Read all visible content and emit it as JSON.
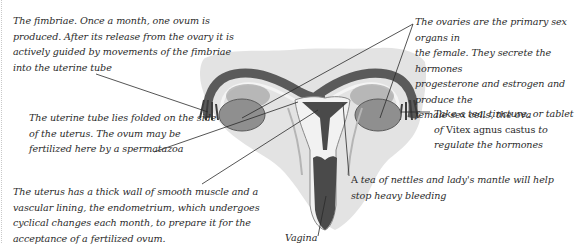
{
  "diagram": {
    "colors": {
      "background": "#ffffff",
      "wash": "#e3e3e3",
      "tissue_dark": "#4a4a4a",
      "tissue_mid": "#7d7d7d",
      "ovary": "#8f8f8f",
      "lining_light": "#f2f2f2",
      "leader_line": "#2a2a2a",
      "text": "#2b2b2b"
    },
    "labels": {
      "fimbriae": "The fimbriae. Once a month, one ovum is\nproduced. After its release from the ovary it is\nactively guided by movements of the fimbriae\ninto the uterine tube",
      "uterine_tube": "The uterine tube lies folded on the side\nof the uterus. The ovum may be\nfertilized here by a spermatazoa",
      "uterus": "The uterus has a thick wall of smooth muscle and a\nvascular lining, the endometrium, which undergoes\ncyclical changes each month, to prepare it for the\nacceptance of a fertilized ovum.",
      "ovaries": "The ovaries are the primary sex organs in\nthe female. They secrete the hormones\nprogesterone and estrogen and produce the\nfemale sex cells, the ova",
      "vitex_line1": "Take a tea, tincture, or tablet",
      "vitex_line2_prefix": "of ",
      "vitex_line2_name": "Vitex agnus castus",
      "vitex_line2_suffix": " to",
      "vitex_line3": "regulate the hormones",
      "nettles_prefix": "A ",
      "nettles_rest": "tea of nettles and lady's mantle will help",
      "nettles_line2": "stop heavy bleeding",
      "vagina": "Vagina"
    }
  }
}
